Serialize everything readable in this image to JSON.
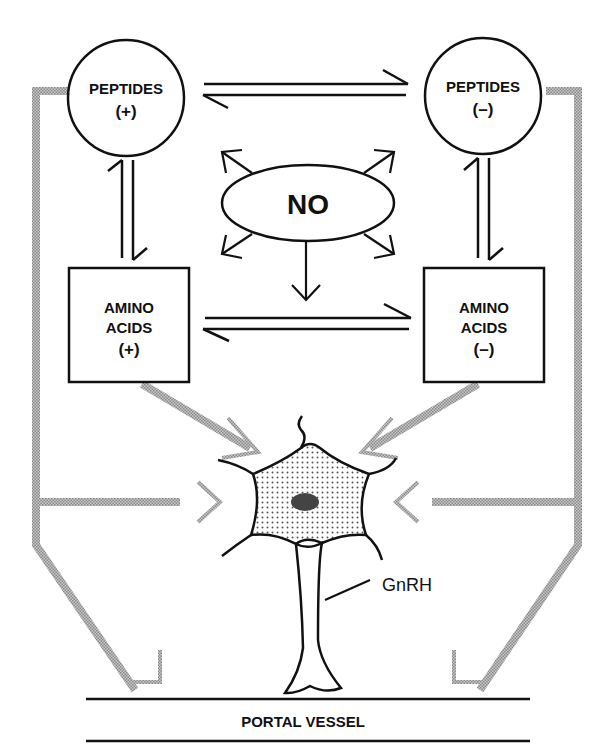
{
  "nodes": {
    "peptides_plus": {
      "line1": "PEPTIDES",
      "line2": "(+)"
    },
    "peptides_minus": {
      "line1": "PEPTIDES",
      "line2": "(–)"
    },
    "no": {
      "label": "NO"
    },
    "amino_plus": {
      "line1": "AMINO",
      "line2": "ACIDS",
      "line3": "(+)"
    },
    "amino_minus": {
      "line1": "AMINO",
      "line2": "ACIDS",
      "line3": "(–)"
    },
    "neuron": {
      "label": "GnRH"
    },
    "vessel": {
      "label": "PORTAL VESSEL"
    }
  },
  "colors": {
    "ink": "#111111",
    "gray_arrow": "#a8a8a8",
    "cell_dots": "#555555",
    "nucleus": "#444444"
  }
}
